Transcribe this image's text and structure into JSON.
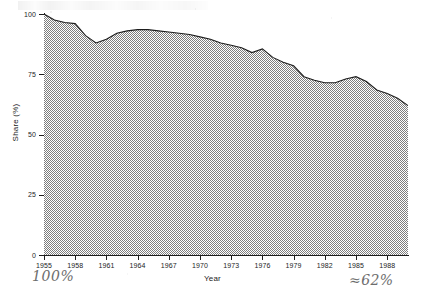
{
  "chart_data": {
    "type": "area",
    "title": "",
    "subtitle": "",
    "xlabel": "Year",
    "ylabel": "Share (%)",
    "xlim": [
      1955,
      1990
    ],
    "ylim": [
      0,
      100
    ],
    "grid": false,
    "legend": null,
    "y_ticks": [
      0,
      25,
      50,
      75,
      100
    ],
    "y_tick_labels": [
      "0",
      "25",
      "50",
      "75",
      "100"
    ],
    "x_ticks": [
      1955,
      1958,
      1961,
      1964,
      1967,
      1970,
      1973,
      1976,
      1979,
      1982,
      1985,
      1988
    ],
    "x_tick_labels": [
      "1955",
      "1958",
      "1961",
      "1964",
      "1967",
      "1970",
      "1973",
      "1976",
      "1979",
      "1982",
      "1985",
      "1988"
    ],
    "fill_style": "checkerboard-dither-50",
    "fill_color": "#9a9a9a",
    "line_color": "#1d1d1d",
    "x": [
      1955,
      1956,
      1957,
      1958,
      1959,
      1960,
      1961,
      1962,
      1963,
      1964,
      1965,
      1966,
      1967,
      1968,
      1969,
      1970,
      1971,
      1972,
      1973,
      1974,
      1975,
      1976,
      1977,
      1978,
      1979,
      1980,
      1981,
      1982,
      1983,
      1984,
      1985,
      1986,
      1987,
      1988,
      1989,
      1990
    ],
    "values": [
      100.0,
      97.5,
      96.5,
      96.0,
      91.0,
      88.0,
      89.5,
      92.0,
      93.0,
      93.5,
      93.5,
      93.0,
      92.5,
      92.0,
      91.5,
      90.5,
      89.5,
      88.0,
      87.0,
      86.0,
      84.0,
      85.5,
      82.0,
      80.0,
      78.5,
      74.0,
      72.5,
      71.5,
      71.5,
      73.0,
      74.0,
      72.0,
      68.5,
      67.0,
      65.0,
      62.0
    ]
  },
  "axes": {
    "y_title": "Share (%)",
    "x_title": "Year"
  },
  "annotations": {
    "left_note": "100%",
    "right_note": "≈62%"
  }
}
